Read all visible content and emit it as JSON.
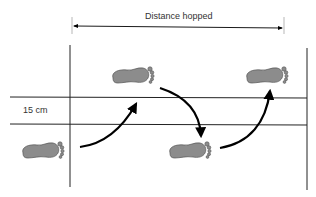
{
  "diagram": {
    "title_label": "Distance hopped",
    "width_label": "15 cm",
    "colors": {
      "line": "#222222",
      "arrow": "#000000",
      "footprint_fill": "#8c8c8c",
      "footprint_stroke": "#555555",
      "text": "#333333"
    },
    "footprints": [
      {
        "name": "footprint-start",
        "x": 43,
        "y": 150
      },
      {
        "name": "footprint-hop-1",
        "x": 133,
        "y": 75
      },
      {
        "name": "footprint-hop-2",
        "x": 190,
        "y": 150
      },
      {
        "name": "footprint-hop-3",
        "x": 267,
        "y": 75
      }
    ],
    "arrows": [
      {
        "name": "hop-arrow-1",
        "from": "footprint-start",
        "to": "footprint-hop-1"
      },
      {
        "name": "hop-arrow-2",
        "from": "footprint-hop-1",
        "to": "footprint-hop-2"
      },
      {
        "name": "hop-arrow-3",
        "from": "footprint-hop-2",
        "to": "footprint-hop-3"
      }
    ]
  }
}
